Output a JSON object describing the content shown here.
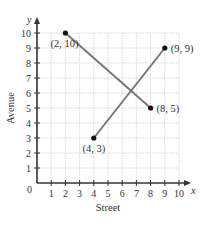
{
  "chart_data": {
    "type": "line",
    "title": "",
    "xlabel": "Street",
    "ylabel": "Avenue",
    "x_axis_var": "x",
    "y_axis_var": "y",
    "xlim": [
      0,
      10
    ],
    "ylim": [
      0,
      10
    ],
    "grid": true,
    "origin_label": "0",
    "x_ticks": [
      "1",
      "2",
      "3",
      "4",
      "5",
      "6",
      "7",
      "8",
      "9",
      "10"
    ],
    "y_ticks": [
      "1",
      "2",
      "3",
      "4",
      "5",
      "6",
      "7",
      "8",
      "9",
      "10"
    ],
    "series": [
      {
        "name": "segment-1",
        "points": [
          {
            "x": 2,
            "y": 10,
            "label": "(2, 10)"
          },
          {
            "x": 8,
            "y": 5,
            "label": "(8, 5)"
          }
        ]
      },
      {
        "name": "segment-2",
        "points": [
          {
            "x": 4,
            "y": 3,
            "label": "(4, 3)"
          },
          {
            "x": 9,
            "y": 9,
            "label": "(9, 9)"
          }
        ]
      }
    ],
    "colors": {
      "line": "#777777",
      "point": "#111111",
      "axis": "#333333",
      "grid": "#c8c8c8"
    }
  }
}
